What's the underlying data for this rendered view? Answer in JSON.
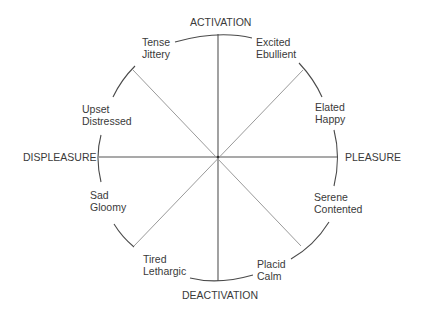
{
  "diagram": {
    "title": "",
    "axes": {
      "top": "ACTIVATION",
      "bottom": "DEACTIVATION",
      "left": "DISPLEASURE",
      "right": "PLEASURE"
    },
    "affects": [
      {
        "position": "upper-left",
        "line1": "Tense",
        "line2": "Jittery"
      },
      {
        "position": "upper-right",
        "line1": "Excited",
        "line2": "Ebullient"
      },
      {
        "position": "right-upper",
        "line1": "Elated",
        "line2": "Happy"
      },
      {
        "position": "right-lower",
        "line1": "Serene",
        "line2": "Contented"
      },
      {
        "position": "lower-right",
        "line1": "Placid",
        "line2": "Calm"
      },
      {
        "position": "lower-left",
        "line1": "Tired",
        "line2": "Lethargic"
      },
      {
        "position": "left-lower",
        "line1": "Sad",
        "line2": "Gloomy"
      },
      {
        "position": "left-upper",
        "line1": "Upset",
        "line2": "Distressed"
      }
    ],
    "colors": {
      "axis_line": "#555555",
      "diagonal_line": "#9a9a9a",
      "arc": "#4a4a4a",
      "text": "#3a3a3a"
    }
  }
}
